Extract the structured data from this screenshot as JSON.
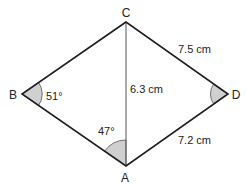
{
  "figure": {
    "type": "kite-like quadrilateral with diagonal",
    "colors": {
      "edge": "#1e1e1e",
      "diagonal": "#555555",
      "angle_fill": "#d0d0d0",
      "text": "#222222"
    },
    "vertices": {
      "A": {
        "label": "A",
        "x": 126,
        "y": 166
      },
      "B": {
        "label": "B",
        "x": 22,
        "y": 94
      },
      "C": {
        "label": "C",
        "x": 126,
        "y": 22
      },
      "D": {
        "label": "D",
        "x": 228,
        "y": 94
      }
    },
    "edges": [
      {
        "from": "C",
        "to": "B"
      },
      {
        "from": "B",
        "to": "A"
      },
      {
        "from": "A",
        "to": "D"
      },
      {
        "from": "D",
        "to": "C"
      }
    ],
    "diagonal": {
      "from": "C",
      "to": "A"
    },
    "lengths": {
      "CD": "7.5 cm",
      "CA": "6.3 cm",
      "AD": "7.2 cm"
    },
    "angles": {
      "B": "51°",
      "CAB": "47°",
      "D": ""
    }
  }
}
